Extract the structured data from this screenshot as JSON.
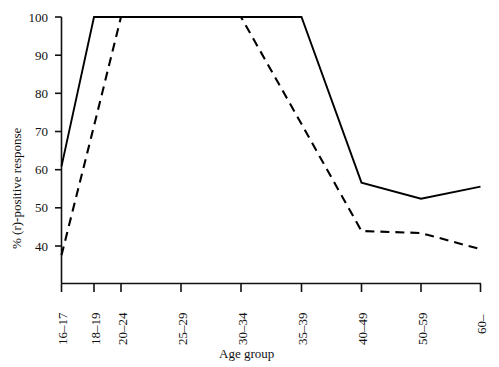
{
  "chart_data": {
    "type": "line",
    "title": "",
    "xlabel": "Age group",
    "ylabel": "% (r)-positive response",
    "categories": [
      "16–17",
      "18–19",
      "20–24",
      "25–29",
      "30–34",
      "35–39",
      "40–49",
      "50–59",
      "60–"
    ],
    "ylim": [
      34,
      100
    ],
    "yticks": [
      40,
      50,
      60,
      70,
      80,
      90,
      100
    ],
    "ytick_labels": [
      "40",
      "50",
      "60",
      "70",
      "80",
      "90",
      "100"
    ],
    "grid": false,
    "legend": "none",
    "series": [
      {
        "name": "solid",
        "style": "solid",
        "color": "#000000",
        "values": [
          63,
          100,
          100,
          100,
          100,
          100,
          59,
          55,
          58
        ]
      },
      {
        "name": "dashed",
        "style": "dashed",
        "color": "#000000",
        "values": [
          41,
          73,
          100,
          100,
          100,
          73.5,
          47,
          46.5,
          42.5
        ]
      }
    ]
  },
  "axes": {
    "y_title": "% (r)-positive response",
    "x_title": "Age group"
  }
}
